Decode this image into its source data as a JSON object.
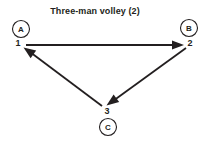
{
  "diagram": {
    "title": "Three-man volley (2)",
    "type": "volleyball-drill-diagram",
    "background_color": "#ffffff",
    "ink_color": "#231f20",
    "players": [
      {
        "id": "A",
        "label": "A",
        "cx": 21,
        "cy": 29,
        "r": 8.5,
        "seq_label": "1",
        "seq_x": 18,
        "seq_y": 43
      },
      {
        "id": "B",
        "label": "B",
        "cx": 189,
        "cy": 28,
        "r": 8.5,
        "seq_label": "2",
        "seq_x": 190,
        "seq_y": 43
      },
      {
        "id": "C",
        "label": "C",
        "cx": 108,
        "cy": 127,
        "r": 8.5,
        "seq_label": "3",
        "seq_x": 107,
        "seq_y": 111
      }
    ],
    "passes": [
      {
        "order": 1,
        "from": "A",
        "to": "B",
        "label_at_tail": "1",
        "label_at_head": "2",
        "x1": 26,
        "y1": 45,
        "x2": 184,
        "y2": 45
      },
      {
        "order": 2,
        "from": "B",
        "to": "C",
        "label_at_tail": "2",
        "label_at_head": "3",
        "x1": 186,
        "y1": 48,
        "x2": 107,
        "y2": 105
      },
      {
        "order": 3,
        "from": "C",
        "to": "A",
        "label_at_tail": "3",
        "label_at_head": "1",
        "x1": 102,
        "y1": 106,
        "x2": 24,
        "y2": 48
      }
    ]
  }
}
